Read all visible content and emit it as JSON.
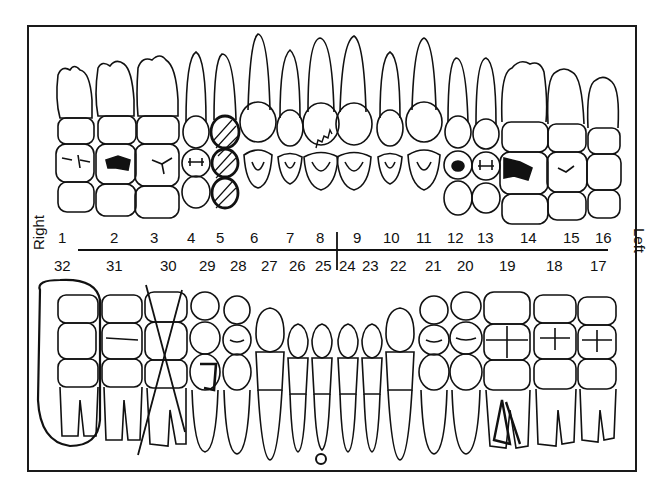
{
  "chart": {
    "title": "",
    "side_labels": {
      "right": "Right",
      "left": "Left"
    },
    "upper_numbers": [
      "1",
      "2",
      "3",
      "4",
      "5",
      "6",
      "7",
      "8",
      "9",
      "10",
      "11",
      "12",
      "13",
      "14",
      "15",
      "16"
    ],
    "lower_numbers": [
      "32",
      "31",
      "30",
      "29",
      "28",
      "27",
      "26",
      "25",
      "24",
      "23",
      "22",
      "21",
      "20",
      "19",
      "18",
      "17"
    ],
    "markings": [
      {
        "tooth": "2",
        "mark": "filled occlusal restoration"
      },
      {
        "tooth": "5",
        "mark": "hatched full crown"
      },
      {
        "tooth": "8",
        "mark": "zigzag fracture line"
      },
      {
        "tooth": "12",
        "mark": "filled occlusal restoration"
      },
      {
        "tooth": "14",
        "mark": "filled occlusal restoration"
      },
      {
        "tooth": "32",
        "mark": "circled (impacted/extract)"
      },
      {
        "tooth": "30",
        "mark": "crossed out (missing)"
      },
      {
        "tooth": "29",
        "mark": "outlined restoration"
      },
      {
        "tooth": "25",
        "mark": "periapical circle"
      },
      {
        "tooth": "19",
        "mark": "root canal"
      }
    ]
  }
}
